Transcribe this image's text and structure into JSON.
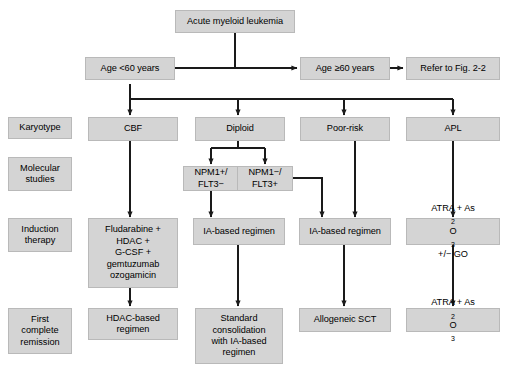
{
  "figure": {
    "root": {
      "label": "Acute myeloid leukemia"
    },
    "age_split": {
      "young": "Age <60 years",
      "old": "Age ≥60 years",
      "refer": "Refer to Fig. 2-2"
    },
    "row_labels": [
      {
        "id": "karyotype",
        "label": "Karyotype"
      },
      {
        "id": "molecular-studies",
        "label": "Molecular\nstudies"
      },
      {
        "id": "induction-therapy",
        "label": "Induction\ntherapy"
      },
      {
        "id": "first-complete-remission",
        "label": "First\ncomplete\nremission"
      }
    ],
    "row_labels_flat": {
      "karyotype": "Karyotype",
      "molecular_line1": "Molecular",
      "molecular_line2": "studies",
      "induction_line1": "Induction",
      "induction_line2": "therapy",
      "remission_line1": "First",
      "remission_line2": "complete",
      "remission_line3": "remission"
    },
    "karyotype_row": {
      "cbf": "CBF",
      "diploid": "Diploid",
      "poor_risk": "Poor-risk",
      "apl": "APL"
    },
    "molecular_row": {
      "npm1_pos_line1": "NPM1+/",
      "npm1_pos_line2": "FLT3−",
      "npm1_neg_line1": "NPM1−/",
      "npm1_neg_line2": "FLT3+"
    },
    "induction_row": {
      "cbf_line1": "Fludarabine +",
      "cbf_line2": "HDAC +",
      "cbf_line3": "G-CSF +",
      "cbf_line4": "gemtuzumab",
      "cbf_line5": "ozogamicin",
      "diploid": "IA-based regimen",
      "poor_risk": "IA-based regimen",
      "apl_line1_a": "ATRA + As",
      "apl_line1_sub1": "2",
      "apl_line1_b": "O",
      "apl_line1_sub2": "3",
      "apl_line2": "+/− GO"
    },
    "remission_row": {
      "cbf_line1": "HDAC-based",
      "cbf_line2": "regimen",
      "diploid_line1": "Standard",
      "diploid_line2": "consolidation",
      "diploid_line3": "with IA-based",
      "diploid_line4": "regimen",
      "poor_risk": "Allogeneic SCT",
      "apl_a": "ATRA + As",
      "apl_sub1": "2",
      "apl_b": "O",
      "apl_sub2": "3"
    },
    "colors": {
      "box_fill": "#d4d4d4",
      "box_border": "#b9b9b9",
      "line": "#1a1a1a",
      "text": "#000000",
      "background": "#ffffff"
    }
  }
}
